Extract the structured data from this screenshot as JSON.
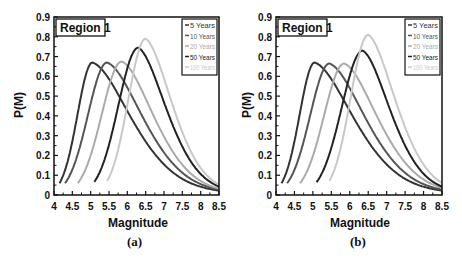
{
  "chart_data": [
    {
      "type": "line",
      "title": "Region 1",
      "caption": "(a)",
      "xlabel": "Magnitude",
      "ylabel": "P(M)",
      "xlim": [
        4,
        8.5
      ],
      "ylim": [
        0,
        0.9
      ],
      "xticks": [
        "4",
        "4.5",
        "5",
        "5.5",
        "6",
        "6.5",
        "7",
        "7.5",
        "8",
        "8.5"
      ],
      "yticks": [
        "0",
        "0.1",
        "0.2",
        "0.3",
        "0.4",
        "0.5",
        "0.6",
        "0.7",
        "0.8",
        "0.9"
      ],
      "grid": false,
      "legend_position": "upper right",
      "series": [
        {
          "name": "5 Years",
          "color": "#333333",
          "start_x": 4.15,
          "peak_x": 5.05,
          "peak_y": 0.67,
          "end_y": 0.01
        },
        {
          "name": "10 Years",
          "color": "#555555",
          "start_x": 4.3,
          "peak_x": 5.45,
          "peak_y": 0.67,
          "end_y": 0.015
        },
        {
          "name": "20 Years",
          "color": "#aaaaaa",
          "start_x": 4.65,
          "peak_x": 5.85,
          "peak_y": 0.675,
          "end_y": 0.02
        },
        {
          "name": "50 Years",
          "color": "#222222",
          "start_x": 5.1,
          "peak_x": 6.3,
          "peak_y": 0.745,
          "end_y": 0.03
        },
        {
          "name": "100 Years",
          "color": "#c8c8c8",
          "start_x": 5.45,
          "peak_x": 6.5,
          "peak_y": 0.79,
          "end_y": 0.04
        }
      ]
    },
    {
      "type": "line",
      "title": "Region 1",
      "caption": "(b)",
      "xlabel": "Magnitude",
      "ylabel": "P(M)",
      "xlim": [
        4,
        8.5
      ],
      "ylim": [
        0,
        0.9
      ],
      "xticks": [
        "4",
        "4.5",
        "5",
        "5.5",
        "6",
        "6.5",
        "7",
        "7.5",
        "8",
        "8.5"
      ],
      "yticks": [
        "0",
        "0.1",
        "0.2",
        "0.3",
        "0.4",
        "0.5",
        "0.6",
        "0.7",
        "0.8",
        "0.9"
      ],
      "grid": false,
      "legend_position": "upper right",
      "series": [
        {
          "name": "5 Years",
          "color": "#333333",
          "start_x": 4.15,
          "peak_x": 5.05,
          "peak_y": 0.67,
          "end_y": 0.01
        },
        {
          "name": "10 Years",
          "color": "#555555",
          "start_x": 4.3,
          "peak_x": 5.45,
          "peak_y": 0.665,
          "end_y": 0.015
        },
        {
          "name": "20 Years",
          "color": "#aaaaaa",
          "start_x": 4.65,
          "peak_x": 5.85,
          "peak_y": 0.665,
          "end_y": 0.025
        },
        {
          "name": "50 Years",
          "color": "#222222",
          "start_x": 5.1,
          "peak_x": 6.35,
          "peak_y": 0.73,
          "end_y": 0.03
        },
        {
          "name": "100 Years",
          "color": "#c8c8c8",
          "start_x": 5.45,
          "peak_x": 6.5,
          "peak_y": 0.81,
          "end_y": 0.05
        }
      ]
    }
  ]
}
